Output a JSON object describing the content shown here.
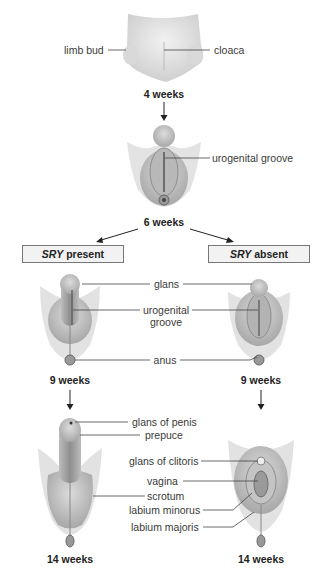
{
  "stages": {
    "week4": {
      "time": "4 weeks",
      "labels": {
        "left": "limb bud",
        "right": "cloaca"
      }
    },
    "week6": {
      "time": "6 weeks",
      "labels": {
        "right": "urogenital groove"
      }
    },
    "branches": {
      "male": {
        "gene": "SRY",
        "status": "present"
      },
      "female": {
        "gene": "SRY",
        "status": "absent"
      }
    },
    "week9": {
      "male_time": "9 weeks",
      "female_time": "9 weeks",
      "shared_labels": {
        "glans": "glans",
        "urogenital_line1": "urogenital",
        "urogenital_line2": "groove",
        "anus": "anus"
      }
    },
    "week14": {
      "male_time": "14 weeks",
      "female_time": "14 weeks",
      "male_labels": {
        "glans": "glans of penis",
        "prepuce": "prepuce",
        "scrotum": "scrotum"
      },
      "female_labels": {
        "glans": "glans of clitoris",
        "vagina": "vagina",
        "minorus": "labium minorus",
        "majoris": "labium majoris"
      }
    }
  },
  "colors": {
    "tissue_light": "#e6e6e6",
    "tissue_mid": "#c9c9c9",
    "tissue_dark": "#9a9a9a",
    "line": "#444444",
    "box_fill": "#f2f2f2"
  }
}
